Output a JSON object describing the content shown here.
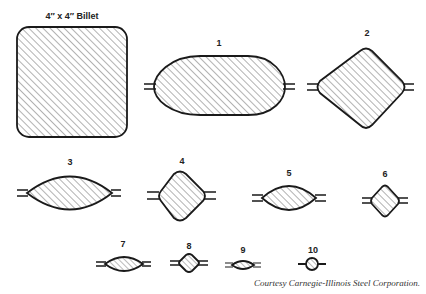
{
  "title": "4″ x 4″ Billet",
  "passes": [
    {
      "label": "1",
      "shape": "oval-flat"
    },
    {
      "label": "2",
      "shape": "diamond"
    },
    {
      "label": "3",
      "shape": "oval"
    },
    {
      "label": "4",
      "shape": "diamond"
    },
    {
      "label": "5",
      "shape": "oval"
    },
    {
      "label": "6",
      "shape": "diamond"
    },
    {
      "label": "7",
      "shape": "oval"
    },
    {
      "label": "8",
      "shape": "diamond"
    },
    {
      "label": "9",
      "shape": "oval"
    },
    {
      "label": "10",
      "shape": "round"
    }
  ],
  "credit": "Courtesy Carnegie-Illinois Steel Corporation.",
  "colors": {
    "stroke": "#1a1a1a",
    "hatch": "#555555",
    "background": "#ffffff"
  }
}
